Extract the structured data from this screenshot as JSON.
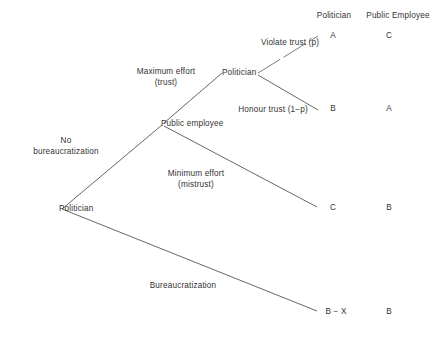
{
  "figure": {
    "type": "extensive-form-game-tree",
    "title": "",
    "background_color": "#ffffff",
    "line_color": "#555555",
    "text_color": "#333333"
  },
  "columns": {
    "politician_header": "Politician",
    "public_employee_header": "Public Employee"
  },
  "nodes": {
    "root": "Politician",
    "public_employee": "Public employee",
    "politician_second": "Politician"
  },
  "branches": {
    "no_bureaucratization": "No\nbureaucratization",
    "bureaucratization": "Bureaucratization",
    "maximum_effort": "Maximum effort\n(trust)",
    "minimum_effort": "Minimum effort\n(mistrust)",
    "violate_trust": "Violate trust (p)",
    "honour_trust": "Honour trust (1−p)"
  },
  "outcomes": [
    {
      "id": "violate-trust",
      "politician_payoff": "A",
      "public_employee_payoff": "C"
    },
    {
      "id": "honour-trust",
      "politician_payoff": "B",
      "public_employee_payoff": "A"
    },
    {
      "id": "minimum-effort",
      "politician_payoff": "C",
      "public_employee_payoff": "B"
    },
    {
      "id": "bureaucratization",
      "politician_payoff": "B − X",
      "public_employee_payoff": "B"
    }
  ]
}
